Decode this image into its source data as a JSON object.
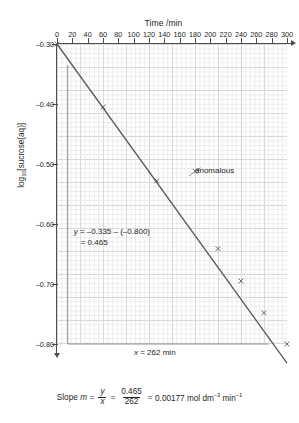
{
  "chart_data": {
    "type": "scatter",
    "title": "Time /min",
    "xlabel": "Time /min",
    "ylabel": "log10[sucrose(aq)]",
    "xlim": [
      0,
      300
    ],
    "ylim": [
      -0.8,
      -0.3
    ],
    "grid": true,
    "legend": "none",
    "x_ticks": [
      0,
      20,
      40,
      60,
      80,
      100,
      120,
      140,
      160,
      180,
      200,
      220,
      240,
      260,
      280,
      300
    ],
    "y_ticks": [
      "–0.30",
      "–0.40",
      "–0.50",
      "–0.60",
      "–0.70",
      "–0.80"
    ],
    "y_tick_values": [
      -0.3,
      -0.4,
      -0.5,
      -0.6,
      -0.7,
      -0.8
    ],
    "x": [
      0,
      60,
      130,
      180,
      210,
      240,
      270,
      300
    ],
    "y": [
      -0.3,
      -0.405,
      -0.528,
      -0.512,
      -0.641,
      -0.695,
      -0.748,
      -0.8
    ],
    "fit_line": {
      "x": [
        0,
        300
      ],
      "y": [
        -0.3,
        -0.832
      ],
      "slope": -0.00177
    },
    "annotations": [
      {
        "name": "anomalous",
        "text": "anomalous",
        "points_to_x": 180,
        "points_to_y": -0.512
      },
      {
        "name": "rise",
        "text_line1": "y = –0.335 – (–0.800)",
        "text_line2": "= 0.465"
      },
      {
        "name": "run",
        "text": "x = 262 min"
      }
    ],
    "construction_lines": [
      {
        "name": "rise-vertical",
        "x": 14,
        "y_from": -0.335,
        "y_to": -0.8
      },
      {
        "name": "run-horizontal",
        "y": -0.8,
        "x_from": 14,
        "x_to": 276
      }
    ]
  },
  "chart": {
    "title": "Time /min",
    "y_axis_label_main": "log",
    "y_axis_label_sub": "10",
    "y_axis_label_rest": "[sucrose(aq)]",
    "x_tick_labels": [
      "0",
      "20",
      "40",
      "60",
      "80",
      "100",
      "120",
      "140",
      "160",
      "180",
      "200",
      "220",
      "240",
      "260",
      "280",
      "300"
    ],
    "y_tick_labels": [
      "–0.30",
      "–0.40",
      "–0.50",
      "–0.60",
      "–0.70",
      "–0.80"
    ]
  },
  "annotations": {
    "anomalous_label": "anomalous",
    "rise_line1": "y = –0.335 – (–0.800)",
    "rise_line2": "= 0.465",
    "run_label": "x = 262 min"
  },
  "slope_caption": {
    "lead": "Slope",
    "m_symbol": "m",
    "equals_1": "=",
    "frac1_num": "y",
    "frac1_den": "x",
    "equals_2": "=",
    "frac2_num": "0.465",
    "frac2_den": "262",
    "equals_3": "=",
    "result_value": "0.00177",
    "result_unit_1": "mol dm",
    "result_unit_exp_1": "–3",
    "result_unit_2": "min",
    "result_unit_exp_2": "–1"
  },
  "colors": {
    "ink": "#231f20",
    "axis": "#4d4d4f",
    "grid_major": "#d8d9dd",
    "grid_minor": "#ececed",
    "data_line": "#58595b",
    "construction": "#8d8f92"
  }
}
